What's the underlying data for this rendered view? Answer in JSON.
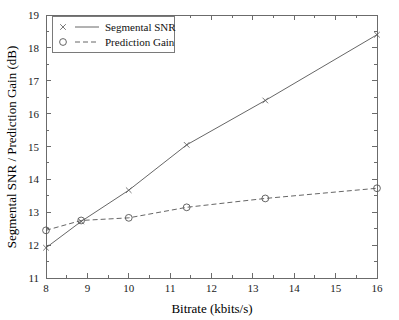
{
  "chart_data": {
    "type": "line",
    "title": "",
    "xlabel": "Bitrate (kbits/s)",
    "ylabel": "Segmental SNR / Prediction Gain (dB)",
    "xlim": [
      8,
      16
    ],
    "ylim": [
      11,
      19
    ],
    "xticks": [
      8,
      9,
      10,
      11,
      12,
      13,
      14,
      15,
      16
    ],
    "xtick_labels": [
      "8",
      "9",
      "10",
      "11",
      "12",
      "13",
      "14",
      "15",
      "16"
    ],
    "yticks": [
      11,
      12,
      13,
      14,
      15,
      16,
      17,
      18,
      19
    ],
    "ytick_labels": [
      "11",
      "12",
      "13",
      "14",
      "15",
      "16",
      "17",
      "18",
      "19"
    ],
    "grid": false,
    "legend_position": "top-left",
    "series": [
      {
        "name": "Segmental SNR",
        "marker": "x",
        "linestyle": "solid",
        "color": "#555555",
        "x": [
          8,
          8.85,
          10,
          11.4,
          13.3,
          16
        ],
        "values": [
          11.92,
          12.72,
          13.67,
          15.05,
          16.4,
          18.4
        ]
      },
      {
        "name": "Prediction Gain",
        "marker": "o",
        "linestyle": "dashed",
        "color": "#555555",
        "x": [
          8,
          8.85,
          10,
          11.4,
          13.3,
          16
        ],
        "values": [
          12.45,
          12.75,
          12.83,
          13.15,
          13.42,
          13.73
        ]
      }
    ]
  },
  "legend": {
    "entries": [
      {
        "label": "Segmental SNR",
        "marker": "x-marker-icon",
        "linestyle": "solid"
      },
      {
        "label": "Prediction Gain",
        "marker": "circle-marker-icon",
        "linestyle": "dashed"
      }
    ]
  },
  "colors": {
    "background": "#ffffff",
    "axis": "#6b6b6b",
    "series": "#555555",
    "text": "#1a1a1a"
  }
}
